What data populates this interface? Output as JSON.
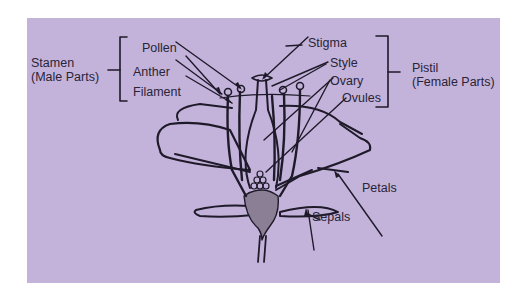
{
  "diagram": {
    "background_color": "#c3b3db",
    "ink_color": "#1f1a29",
    "groups": [
      {
        "id": "stamen",
        "line1": "Stamen",
        "line2": "(Male Parts)",
        "members": [
          "Pollen",
          "Anther",
          "Filament"
        ]
      },
      {
        "id": "pistil",
        "line1": "Pistil",
        "line2": "(Female Parts)",
        "members": [
          "Stigma",
          "Style",
          "Ovary",
          "Ovules"
        ]
      }
    ],
    "labels": {
      "pollen": "Pollen",
      "anther": "Anther",
      "filament": "Filament",
      "stigma": "Stigma",
      "style": "Style",
      "ovary": "Ovary",
      "ovules": "Ovules",
      "petals": "Petals",
      "sepals": "Sepals"
    }
  }
}
